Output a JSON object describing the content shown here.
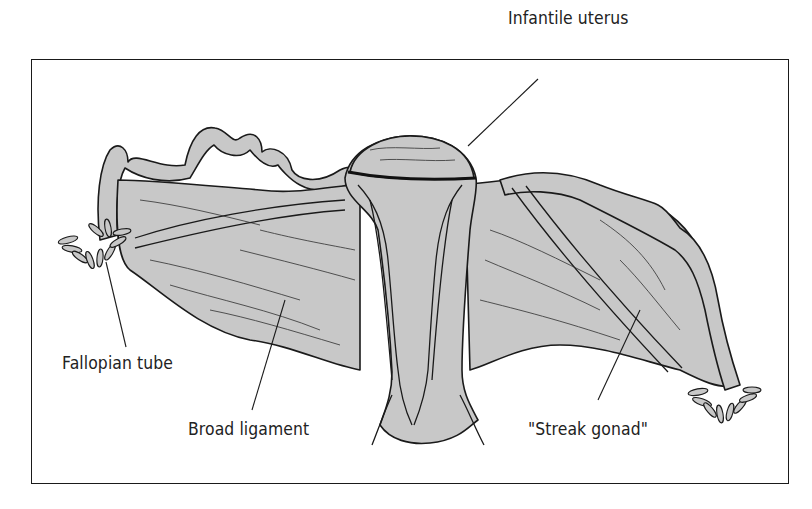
{
  "figure": {
    "labels": [
      {
        "id": "infantile-uterus",
        "text": "Infantile uterus"
      },
      {
        "id": "fallopian-tube",
        "text": "Fallopian tube"
      },
      {
        "id": "broad-ligament",
        "text": "Broad ligament"
      },
      {
        "id": "streak-gonad",
        "text": "\"Streak gonad\""
      }
    ],
    "colors": {
      "tissue_fill": "#c8c8c8",
      "outline": "#1a1a1a",
      "frame_border": "#1a1a1a",
      "background": "#ffffff"
    }
  }
}
